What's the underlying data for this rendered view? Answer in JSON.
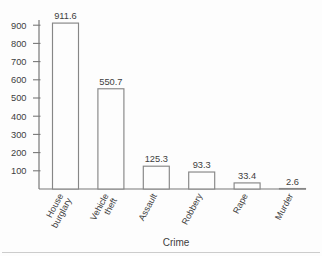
{
  "figure": {
    "background": "#fdfdfd",
    "axis_color": "#787878",
    "bar_stroke_color": "#868686",
    "bar_fill_color": "#fdfdfd",
    "text_color": "#3d3d3d",
    "bottom_rule_color": "#c6c6c6"
  },
  "chart_data": {
    "type": "bar",
    "title": "",
    "xlabel": "Crime",
    "ylabel": "",
    "categories": [
      "House burglary",
      "Vehicle theft",
      "Assault",
      "Robbery",
      "Rape",
      "Murder"
    ],
    "category_lines": [
      [
        "House",
        "burglary"
      ],
      [
        "Vehicle",
        "theft"
      ],
      [
        "Assault"
      ],
      [
        "Robbery"
      ],
      [
        "Rape"
      ],
      [
        "Murder"
      ]
    ],
    "values": [
      911.6,
      550.7,
      125.3,
      93.3,
      33.4,
      2.6
    ],
    "value_labels": [
      "911.6",
      "550.7",
      "125.3",
      "93.3",
      "33.4",
      "2.6"
    ],
    "y_ticks": [
      100,
      200,
      300,
      400,
      500,
      600,
      700,
      800,
      900
    ],
    "ylim": [
      0,
      950
    ],
    "grid": false,
    "legend": null,
    "bar_outline_only": true,
    "x_labels_rotated": true
  }
}
